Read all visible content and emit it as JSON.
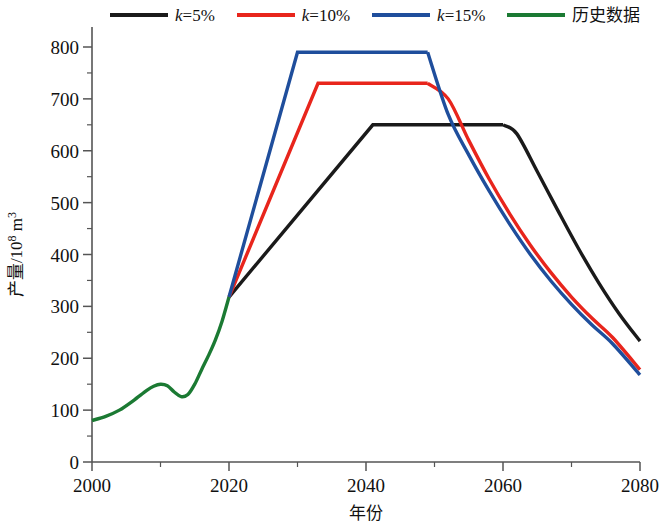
{
  "chart_data": {
    "type": "line",
    "title": "",
    "xlabel": "年份",
    "ylabel": "产量/10⁸ m³",
    "ylabel_main": "产量/10",
    "ylabel_exp": "8",
    "ylabel_unit": " m",
    "ylabel_unit_exp": "3",
    "xlim": [
      2000,
      2080
    ],
    "ylim": [
      0,
      800
    ],
    "xticks": [
      2000,
      2020,
      2040,
      2060,
      2080
    ],
    "xtick_labels": [
      "2000",
      "2020",
      "2040",
      "2060",
      "2080"
    ],
    "xminor_step": 10,
    "yticks": [
      0,
      100,
      200,
      300,
      400,
      500,
      600,
      700,
      800
    ],
    "ytick_labels": [
      "0",
      "100",
      "200",
      "300",
      "400",
      "500",
      "600",
      "700",
      "800"
    ],
    "yminor_step": 50,
    "grid": false,
    "legend_position": "top",
    "series": [
      {
        "name": "k=5%",
        "label_prefix": "k",
        "label_suffix": "=5%",
        "color": "#1a1a1a",
        "x": [
          2020,
          2041,
          2060,
          2062,
          2065,
          2068,
          2071,
          2074,
          2077,
          2080
        ],
        "values": [
          318,
          650,
          650,
          633,
          560,
          485,
          412,
          345,
          285,
          233
        ]
      },
      {
        "name": "k=10%",
        "label_prefix": "k",
        "label_suffix": "=10%",
        "color": "#e8251c",
        "x": [
          2033,
          2049,
          2052,
          2055,
          2058,
          2061,
          2064,
          2067,
          2070,
          2073,
          2076,
          2080
        ],
        "values": [
          730,
          730,
          700,
          620,
          545,
          478,
          418,
          365,
          318,
          277,
          240,
          178
        ],
        "x_start": 2020,
        "value_start": 318
      },
      {
        "name": "k=15%",
        "label_prefix": "k",
        "label_suffix": "=15%",
        "color": "#1f4e9c",
        "x": [
          2030,
          2049,
          2052,
          2055,
          2058,
          2061,
          2064,
          2067,
          2070,
          2073,
          2076,
          2080
        ],
        "values": [
          790,
          790,
          670,
          592,
          522,
          458,
          400,
          349,
          304,
          264,
          228,
          168
        ],
        "x_start": 2020,
        "value_start": 318
      },
      {
        "name": "历史数据",
        "label_prefix": "",
        "label_suffix": "历史数据",
        "color": "#1b7a33",
        "x": [
          2000,
          2002,
          2004,
          2006,
          2008,
          2009,
          2010,
          2011,
          2012,
          2013,
          2014,
          2015,
          2016,
          2017,
          2018,
          2019,
          2020
        ],
        "values": [
          80,
          88,
          100,
          118,
          138,
          146,
          150,
          147,
          135,
          126,
          130,
          150,
          178,
          205,
          235,
          272,
          318
        ]
      }
    ]
  },
  "legend": {
    "items": [
      {
        "label_k": "k",
        "label_rest": "=5%",
        "color": "#1a1a1a",
        "name": "k5"
      },
      {
        "label_k": "k",
        "label_rest": "=10%",
        "color": "#e8251c",
        "name": "k10"
      },
      {
        "label_k": "k",
        "label_rest": "=15%",
        "color": "#1f4e9c",
        "name": "k15"
      },
      {
        "label_k": "",
        "label_rest": "历史数据",
        "color": "#1b7a33",
        "name": "history"
      }
    ]
  },
  "axes": {
    "x_title": "年份",
    "y_title_main": "产量/10",
    "y_title_sup": "8",
    "y_title_tail": " m",
    "y_title_tail_sup": "3"
  }
}
